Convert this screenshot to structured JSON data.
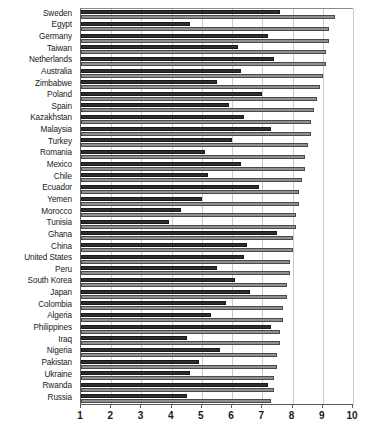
{
  "chart_data": {
    "type": "bar",
    "orientation": "horizontal",
    "title": "",
    "subtitle": "",
    "xlabel": "",
    "ylabel": "",
    "xlim": [
      1,
      10
    ],
    "xticks": [
      1,
      2,
      3,
      4,
      5,
      6,
      7,
      8,
      9,
      10
    ],
    "xticklabels": [
      "1",
      "2",
      "3",
      "4",
      "5",
      "6",
      "7",
      "8",
      "9",
      "10"
    ],
    "grid": true,
    "grid_axis": "x",
    "legend": false,
    "legend_position": "none",
    "colors": {
      "series_dark": "#2f2f2f",
      "series_light": "#909090",
      "gridline": "#c9c9c9",
      "axis": "#5a5a5a",
      "text": "#1a1a1a",
      "background": "#ffffff"
    },
    "categories": [
      "Sweden",
      "Egypt",
      "Germany",
      "Taiwan",
      "Netherlands",
      "Australia",
      "Zimbabwe",
      "Poland",
      "Spain",
      "Kazakhstan",
      "Malaysia",
      "Turkey",
      "Romania",
      "Mexico",
      "Chile",
      "Ecuador",
      "Yemen",
      "Morocco",
      "Tunisia",
      "Ghana",
      "China",
      "United States",
      "Peru",
      "South Korea",
      "Japan",
      "Colombia",
      "Algeria",
      "Philippines",
      "Iraq",
      "Nigeria",
      "Pakistan",
      "Ukraine",
      "Rwanda",
      "Russia"
    ],
    "series": [
      {
        "name": "series-dark",
        "values": [
          7.6,
          4.6,
          7.2,
          6.2,
          7.4,
          6.3,
          5.5,
          7.0,
          5.9,
          6.4,
          7.3,
          6.0,
          5.1,
          6.3,
          5.2,
          6.9,
          5.0,
          4.3,
          3.9,
          7.5,
          6.5,
          6.4,
          5.5,
          6.1,
          6.6,
          5.8,
          5.3,
          7.3,
          4.5,
          5.6,
          4.9,
          4.6,
          7.2,
          4.5
        ]
      },
      {
        "name": "series-light",
        "values": [
          9.4,
          9.2,
          9.2,
          9.1,
          9.1,
          9.0,
          8.9,
          8.8,
          8.7,
          8.6,
          8.6,
          8.5,
          8.4,
          8.4,
          8.3,
          8.2,
          8.2,
          8.1,
          8.1,
          8.0,
          8.0,
          7.9,
          7.9,
          7.8,
          7.8,
          7.7,
          7.7,
          7.6,
          7.6,
          7.5,
          7.5,
          7.4,
          7.4,
          7.3
        ]
      }
    ]
  }
}
